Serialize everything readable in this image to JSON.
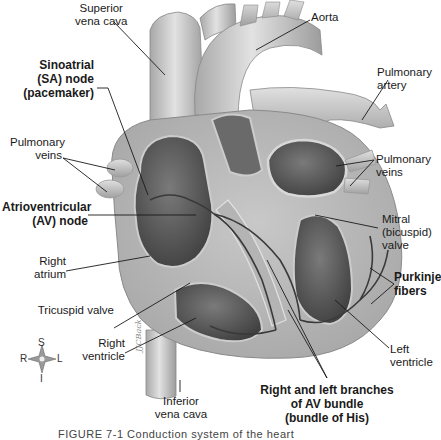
{
  "figure": {
    "subject": "Conduction system of the heart",
    "caption": "FIGURE 7-1  Conduction system of the heart",
    "artist_signature": "JJCBack"
  },
  "labels": {
    "superior_vena_cava": [
      "Superior",
      "vena cava"
    ],
    "aorta": [
      "Aorta"
    ],
    "sa_node": [
      "Sinoatrial",
      "(SA) node",
      "(pacemaker)"
    ],
    "pulmonary_artery": [
      "Pulmonary",
      "artery"
    ],
    "pulmonary_veins_left": [
      "Pulmonary",
      "veins"
    ],
    "pulmonary_veins_right": [
      "Pulmonary",
      "veins"
    ],
    "av_node": [
      "Atrioventricular",
      "(AV) node"
    ],
    "mitral_valve": [
      "Mitral",
      "(bicuspid)",
      "valve"
    ],
    "right_atrium": [
      "Right",
      "atrium"
    ],
    "purkinje_fibers": [
      "Purkinje",
      "fibers"
    ],
    "tricuspid_valve": [
      "Tricuspid valve"
    ],
    "right_ventricle": [
      "Right",
      "ventricle"
    ],
    "left_ventricle": [
      "Left",
      "ventricle"
    ],
    "av_bundle": [
      "Right and left branches",
      "of AV bundle",
      "(bundle of His)"
    ],
    "inferior_vena_cava": [
      "Inferior",
      "vena cava"
    ]
  },
  "compass": {
    "top": "S",
    "left": "R",
    "right": "L",
    "bottom": "I"
  },
  "colors": {
    "background": "#ffffff",
    "tissue_light": "#d4d4d4",
    "tissue_mid": "#9a9a9a",
    "tissue_dark": "#4a4a4a",
    "leader_line": "#1a1a1a"
  }
}
